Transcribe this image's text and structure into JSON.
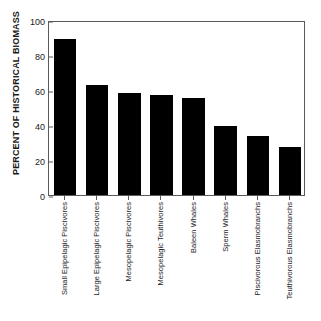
{
  "chart_data": {
    "type": "bar",
    "title": "",
    "xlabel": "",
    "ylabel": "PERCENT OF HISTORICAL BIOMASS",
    "ylim": [
      0,
      100
    ],
    "yticks": [
      0,
      20,
      40,
      60,
      80,
      100
    ],
    "grid": false,
    "legend": null,
    "bar_color": "#000000",
    "frame_color": "#5a5a5a",
    "categories": [
      "Small Epipelagic Piscivores",
      "Large Epipelagic Piscivores",
      "Mesopelagic Piscivores",
      "Mesopelagic Teuthivores",
      "Baleen Whales",
      "Sperm Whales",
      "Piscivorous Elasmobranchs",
      "Teuthivorous Elasmobranchs"
    ],
    "values": [
      89,
      63,
      58.5,
      57,
      55.5,
      39.5,
      33.5,
      27.5
    ]
  },
  "axis": {
    "y_title": "PERCENT OF HISTORICAL BIOMASS",
    "tick_0": "0",
    "tick_20": "20",
    "tick_40": "40",
    "tick_60": "60",
    "tick_80": "80",
    "tick_100": "100"
  }
}
